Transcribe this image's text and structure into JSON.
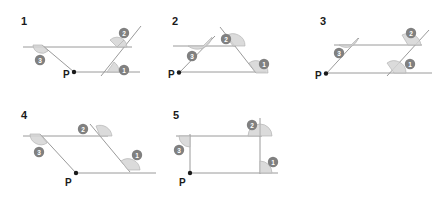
{
  "page": {
    "background": "#ffffff",
    "line_color": "#9a9a9a",
    "wedge_color": "#d5d5d5",
    "badge_color": "#808080",
    "badge_text_color": "#ffffff",
    "label_color": "#1a1a1a"
  },
  "figures": [
    {
      "number": "1",
      "point_label": "P",
      "angle_badges": [
        "1",
        "2",
        "3"
      ],
      "shape": "trapezoid with two parallel horizontal lines cut by two transversals"
    },
    {
      "number": "2",
      "point_label": "P",
      "angle_badges": [
        "1",
        "2",
        "3"
      ],
      "shape": "triangle with a horizontal segment parallel to the base"
    },
    {
      "number": "3",
      "point_label": "P",
      "angle_badges": [
        "1",
        "2",
        "3"
      ],
      "shape": "parallelogram formed by two parallel horizontal lines and two parallel transversals"
    },
    {
      "number": "4",
      "point_label": "P",
      "angle_badges": [
        "1",
        "2",
        "3"
      ],
      "shape": "parallelogram with two parallel horizontal lines and two parallel slanted transversals"
    },
    {
      "number": "5",
      "point_label": "P",
      "angle_badges": [
        "1",
        "2",
        "3"
      ],
      "shape": "rectangle formed by two parallel horizontal lines and two vertical transversals"
    }
  ]
}
